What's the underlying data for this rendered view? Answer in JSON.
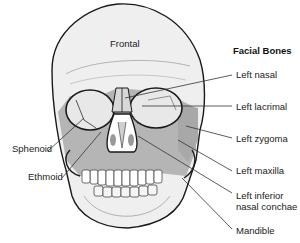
{
  "diagram": {
    "title": "Facial Bones",
    "labels": {
      "frontal": "Frontal",
      "left_nasal": "Left nasal",
      "left_lacrimal": "Left lacrimal",
      "left_zygoma": "Left zygoma",
      "left_maxilla": "Left maxilla",
      "left_inferior_line1": "Left inferior",
      "left_inferior_line2": "nasal conchae",
      "mandible": "Mandible",
      "sphenoid": "Sphenoid",
      "ethmoid": "Ethmoid"
    },
    "colors": {
      "bone_light": "#efefef",
      "bone_shaded": "#b5b5b5",
      "outline": "#1a1a1a"
    }
  }
}
